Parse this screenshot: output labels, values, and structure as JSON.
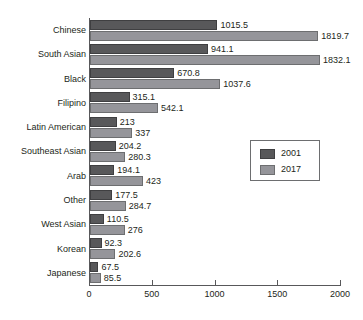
{
  "chart_data": {
    "type": "bar",
    "orientation": "horizontal",
    "title": "",
    "xlabel": "",
    "ylabel": "",
    "xlim": [
      0,
      2000
    ],
    "xticks": [
      0,
      500,
      1000,
      1500,
      2000
    ],
    "xtick_labels": [
      "0",
      "500",
      "1000",
      "1500",
      "2000"
    ],
    "grid": false,
    "legend_position": "center-right",
    "categories": [
      "Chinese",
      "South Asian",
      "Black",
      "Filipino",
      "Latin American",
      "Southeast Asian",
      "Arab",
      "Other",
      "West Asian",
      "Korean",
      "Japanese"
    ],
    "series": [
      {
        "name": "2001",
        "color": "#58585a",
        "values": [
          1015.5,
          941.1,
          670.8,
          315.1,
          213,
          204.2,
          194.1,
          177.5,
          110.5,
          92.3,
          67.5
        ],
        "labels": [
          "1015.5",
          "941.1",
          "670.8",
          "315.1",
          "213",
          "204.2",
          "194.1",
          "177.5",
          "110.5",
          "92.3",
          "67.5"
        ]
      },
      {
        "name": "2017",
        "color": "#95959a",
        "values": [
          1819.7,
          1832.1,
          1037.6,
          542.1,
          337,
          280.3,
          423,
          284.7,
          276,
          202.6,
          85.5
        ],
        "labels": [
          "1819.7",
          "1832.1",
          "1037.6",
          "542.1",
          "337",
          "280.3",
          "423",
          "284.7",
          "276",
          "202.6",
          "85.5"
        ]
      }
    ]
  },
  "legend": {
    "entries": [
      {
        "label": "2001",
        "color": "#58585a"
      },
      {
        "label": "2017",
        "color": "#95959a"
      }
    ]
  },
  "colors": {
    "series_2001": "#58585a",
    "series_2017": "#95959a",
    "axis": "#58585a",
    "text": "#231f20",
    "background": "#ffffff"
  }
}
